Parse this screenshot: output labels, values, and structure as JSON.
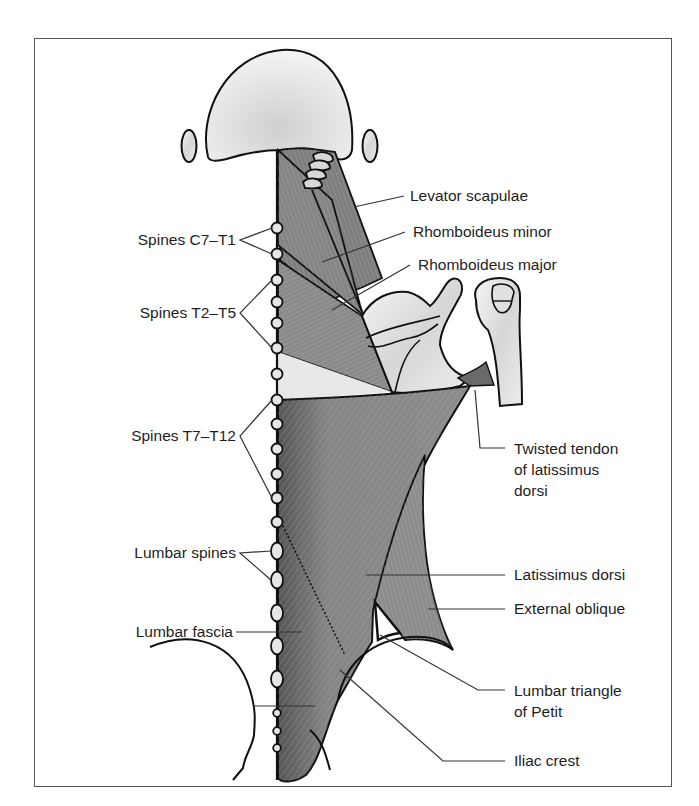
{
  "figure": {
    "colors": {
      "bone_fill": "#e2e2e2",
      "bone_highlight": "#f5f5f5",
      "muscle_dark": "#6f6f6f",
      "muscle_mid": "#8a8a8a",
      "muscle_light": "#a8a8a8",
      "outline": "#111111",
      "leader_line": "#333333",
      "frame": "#555555",
      "text": "#1e1e1e"
    }
  },
  "labels_left": [
    {
      "id": "spines-c7-t1",
      "text": "Spines C7–T1"
    },
    {
      "id": "spines-t2-t5",
      "text": "Spines T2–T5"
    },
    {
      "id": "spines-t7-t12",
      "text": "Spines T7–T12"
    },
    {
      "id": "lumbar-spines",
      "text": "Lumbar spines"
    },
    {
      "id": "lumbar-fascia",
      "text": "Lumbar fascia"
    }
  ],
  "labels_right": [
    {
      "id": "levator-scapulae",
      "text": "Levator scapulae"
    },
    {
      "id": "rhomboideus-minor",
      "text": "Rhomboideus minor"
    },
    {
      "id": "rhomboideus-major",
      "text": "Rhomboideus major"
    },
    {
      "id": "twisted-tendon",
      "text": "Twisted tendon\nof latissimus\ndorsi"
    },
    {
      "id": "latissimus-dorsi",
      "text": "Latissimus dorsi"
    },
    {
      "id": "external-oblique",
      "text": "External oblique"
    },
    {
      "id": "lumbar-triangle",
      "text": "Lumbar triangle\nof Petit"
    },
    {
      "id": "iliac-crest",
      "text": "Iliac crest"
    }
  ]
}
